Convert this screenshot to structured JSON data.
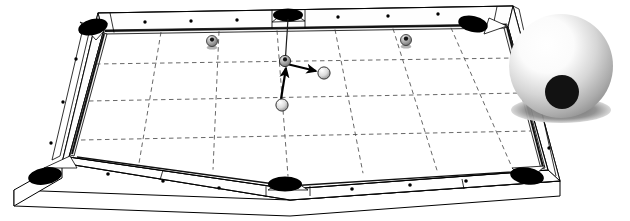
{
  "figure": {
    "background_color": "#ffffff",
    "width": 630,
    "height": 221
  },
  "table": {
    "name": "billiard-table",
    "surface_color": "#ffffff",
    "rail_color": "#fdfdfd",
    "outline_color": "#000000",
    "pocket_color": "#000000",
    "grid": {
      "visible": true,
      "style": "dashed",
      "color": "#444444",
      "columns": 6,
      "rows": 4
    },
    "pockets": [
      {
        "label": "top-left-corner-pocket",
        "cx": 93,
        "cy": 27,
        "rx": 15,
        "ry": 8
      },
      {
        "label": "top-middle-pocket",
        "cx": 288,
        "cy": 14,
        "rx": 15,
        "ry": 7
      },
      {
        "label": "top-right-corner-pocket",
        "cx": 473,
        "cy": 23,
        "rx": 15,
        "ry": 8
      },
      {
        "label": "bottom-left-corner-pocket",
        "cx": 45,
        "cy": 176,
        "rx": 17,
        "ry": 9
      },
      {
        "label": "bottom-middle-pocket",
        "cx": 285,
        "cy": 184,
        "rx": 17,
        "ry": 8
      },
      {
        "label": "bottom-right-corner-pocket",
        "cx": 527,
        "cy": 176,
        "rx": 17,
        "ry": 9
      }
    ],
    "diamonds": {
      "color": "#000000",
      "count_top": 6,
      "count_bottom": 6,
      "count_left": 3,
      "count_right": 3
    }
  },
  "balls": [
    {
      "name": "object-ball-top-left",
      "type": "spotted",
      "cx": 212,
      "cy": 41,
      "r": 5.5,
      "spot_color": "#1a1a1a",
      "body_color": "#b4b4b4"
    },
    {
      "name": "object-ball-top-right",
      "type": "spotted",
      "cx": 406,
      "cy": 40,
      "r": 5.5,
      "spot_color": "#1a1a1a",
      "body_color": "#b4b4b4"
    },
    {
      "name": "contact-ball-center",
      "type": "spotted",
      "cx": 285,
      "cy": 61,
      "r": 5.5,
      "spot_color": "#1a1a1a",
      "body_color": "#9e9e9e"
    },
    {
      "name": "cue-ball-lower",
      "type": "plain",
      "cx": 282,
      "cy": 105,
      "r": 6.0,
      "spot_color": "none",
      "body_color": "#f2f2f2"
    },
    {
      "name": "target-ball-right",
      "type": "plain",
      "cx": 324,
      "cy": 73,
      "r": 6.0,
      "spot_color": "none",
      "body_color": "#f2f2f2"
    }
  ],
  "arrows": [
    {
      "name": "incoming-cue-path-arrow",
      "from_x": 281,
      "from_y": 99,
      "to_x": 286,
      "to_y": 67,
      "color": "#000000",
      "label": "cue ball travel"
    },
    {
      "name": "outgoing-deflection-arrow",
      "from_x": 289,
      "from_y": 64,
      "to_x": 317,
      "to_y": 71,
      "color": "#000000",
      "label": "deflection"
    }
  ],
  "aiming_line": {
    "name": "pocket-aim-line",
    "from_x": 288,
    "from_y": 18,
    "to_x": 285,
    "to_y": 58,
    "color": "#222222"
  },
  "magnified_ball": {
    "name": "magnified-cue-ball",
    "cx": 561,
    "cy": 66,
    "r": 52,
    "highlight_color": "#ffffff",
    "mid_color": "#d2d2d2",
    "edge_color": "#8f8f8f",
    "spot": {
      "cx": 562,
      "cy": 92,
      "r": 17,
      "color": "#111111"
    },
    "shadow": {
      "cx": 561,
      "cy": 110,
      "rx": 50,
      "ry": 13,
      "color": "#7a7a7a"
    }
  },
  "labels": {
    "caption": ""
  }
}
